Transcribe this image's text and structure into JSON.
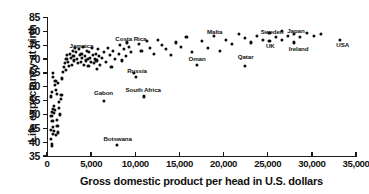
{
  "chart_data": {
    "type": "scatter",
    "title": "",
    "xlabel": "Gross domestic product per head in U.S. dollars",
    "ylabel": "Life expectancy at birth",
    "xlim": [
      0,
      35000
    ],
    "ylim": [
      35,
      85
    ],
    "grid": false,
    "legend": null,
    "xticks": [
      0,
      5000,
      10000,
      15000,
      20000,
      25000,
      30000,
      35000
    ],
    "xtick_labels": [
      "0",
      "5,000",
      "10,000",
      "15,000",
      "20,000",
      "25,000",
      "30,000",
      "35,000"
    ],
    "yticks": [
      35,
      40,
      45,
      50,
      55,
      60,
      65,
      70,
      75,
      80,
      85
    ],
    "ytick_labels": [
      "35",
      "40",
      "45",
      "50",
      "55",
      "60",
      "65",
      "70",
      "75",
      "80",
      "85"
    ],
    "marker": "filled-circle",
    "marker_color": "#0d0d0d",
    "annotations": [
      {
        "label": "Jamaica",
        "x": 3900,
        "y": 74.5
      },
      {
        "label": "Costa Rica",
        "x": 9500,
        "y": 77.0
      },
      {
        "label": "Russia",
        "x": 10200,
        "y": 65.5
      },
      {
        "label": "Gabon",
        "x": 6400,
        "y": 57.5
      },
      {
        "label": "South Africa",
        "x": 10900,
        "y": 58.5
      },
      {
        "label": "Botswana",
        "x": 8000,
        "y": 41.0
      },
      {
        "label": "Malta",
        "x": 19000,
        "y": 79.5
      },
      {
        "label": "Oman",
        "x": 17000,
        "y": 70.0
      },
      {
        "label": "Qatar",
        "x": 22500,
        "y": 70.5
      },
      {
        "label": "Sweden",
        "x": 25500,
        "y": 79.5
      },
      {
        "label": "UK",
        "x": 25300,
        "y": 74.5
      },
      {
        "label": "Japan",
        "x": 28200,
        "y": 80.0
      },
      {
        "label": "Ireland",
        "x": 28500,
        "y": 73.5
      },
      {
        "label": "USA",
        "x": 33500,
        "y": 75.0
      }
    ],
    "points": [
      {
        "x": 500,
        "y": 49.5
      },
      {
        "x": 560,
        "y": 51.0
      },
      {
        "x": 620,
        "y": 47.5
      },
      {
        "x": 430,
        "y": 44.5
      },
      {
        "x": 700,
        "y": 52.0
      },
      {
        "x": 760,
        "y": 50.5
      },
      {
        "x": 480,
        "y": 41.0
      },
      {
        "x": 540,
        "y": 39.5
      },
      {
        "x": 600,
        "y": 38.5
      },
      {
        "x": 820,
        "y": 53.0
      },
      {
        "x": 900,
        "y": 51.5
      },
      {
        "x": 640,
        "y": 43.0
      },
      {
        "x": 720,
        "y": 45.5
      },
      {
        "x": 780,
        "y": 44.0
      },
      {
        "x": 450,
        "y": 56.5
      },
      {
        "x": 520,
        "y": 58.0
      },
      {
        "x": 880,
        "y": 60.5
      },
      {
        "x": 960,
        "y": 62.0
      },
      {
        "x": 1050,
        "y": 59.0
      },
      {
        "x": 1130,
        "y": 57.5
      },
      {
        "x": 1200,
        "y": 61.5
      },
      {
        "x": 700,
        "y": 63.5
      },
      {
        "x": 640,
        "y": 65.0
      },
      {
        "x": 1320,
        "y": 54.5
      },
      {
        "x": 1400,
        "y": 52.5
      },
      {
        "x": 1480,
        "y": 50.0
      },
      {
        "x": 1100,
        "y": 48.0
      },
      {
        "x": 1180,
        "y": 46.0
      },
      {
        "x": 980,
        "y": 42.5
      },
      {
        "x": 1260,
        "y": 43.5
      },
      {
        "x": 1560,
        "y": 55.5
      },
      {
        "x": 1640,
        "y": 57.0
      },
      {
        "x": 1720,
        "y": 63.0
      },
      {
        "x": 1800,
        "y": 65.5
      },
      {
        "x": 1900,
        "y": 67.0
      },
      {
        "x": 2000,
        "y": 68.5
      },
      {
        "x": 2100,
        "y": 66.0
      },
      {
        "x": 2200,
        "y": 70.0
      },
      {
        "x": 2300,
        "y": 71.5
      },
      {
        "x": 2400,
        "y": 69.0
      },
      {
        "x": 2500,
        "y": 67.5
      },
      {
        "x": 2600,
        "y": 72.0
      },
      {
        "x": 2700,
        "y": 70.5
      },
      {
        "x": 2800,
        "y": 68.0
      },
      {
        "x": 2900,
        "y": 73.0
      },
      {
        "x": 3000,
        "y": 71.0
      },
      {
        "x": 3100,
        "y": 69.5
      },
      {
        "x": 3200,
        "y": 74.0
      },
      {
        "x": 3300,
        "y": 72.5
      },
      {
        "x": 3400,
        "y": 70.0
      },
      {
        "x": 3500,
        "y": 68.5
      },
      {
        "x": 3600,
        "y": 73.5
      },
      {
        "x": 3700,
        "y": 71.5
      },
      {
        "x": 3800,
        "y": 69.0
      },
      {
        "x": 3900,
        "y": 72.0
      },
      {
        "x": 4000,
        "y": 70.5
      },
      {
        "x": 4100,
        "y": 74.5
      },
      {
        "x": 4200,
        "y": 68.0
      },
      {
        "x": 4300,
        "y": 71.0
      },
      {
        "x": 4400,
        "y": 69.5
      },
      {
        "x": 4500,
        "y": 73.0
      },
      {
        "x": 4600,
        "y": 70.0
      },
      {
        "x": 4700,
        "y": 67.5
      },
      {
        "x": 4800,
        "y": 72.5
      },
      {
        "x": 4900,
        "y": 70.5
      },
      {
        "x": 5000,
        "y": 69.0
      },
      {
        "x": 5100,
        "y": 74.0
      },
      {
        "x": 5200,
        "y": 71.5
      },
      {
        "x": 5300,
        "y": 68.5
      },
      {
        "x": 5400,
        "y": 70.0
      },
      {
        "x": 5500,
        "y": 72.0
      },
      {
        "x": 5600,
        "y": 69.5
      },
      {
        "x": 5700,
        "y": 66.5
      },
      {
        "x": 5800,
        "y": 73.5
      },
      {
        "x": 5900,
        "y": 71.0
      },
      {
        "x": 6000,
        "y": 68.0
      },
      {
        "x": 6200,
        "y": 70.5
      },
      {
        "x": 6400,
        "y": 55.0
      },
      {
        "x": 6500,
        "y": 72.5
      },
      {
        "x": 6700,
        "y": 69.0
      },
      {
        "x": 6900,
        "y": 74.0
      },
      {
        "x": 7100,
        "y": 71.5
      },
      {
        "x": 7300,
        "y": 67.0
      },
      {
        "x": 7500,
        "y": 73.0
      },
      {
        "x": 7700,
        "y": 70.0
      },
      {
        "x": 7900,
        "y": 39.0
      },
      {
        "x": 8100,
        "y": 72.0
      },
      {
        "x": 8300,
        "y": 75.0
      },
      {
        "x": 8500,
        "y": 69.5
      },
      {
        "x": 8700,
        "y": 73.5
      },
      {
        "x": 8900,
        "y": 71.0
      },
      {
        "x": 9100,
        "y": 76.0
      },
      {
        "x": 9300,
        "y": 74.5
      },
      {
        "x": 9500,
        "y": 72.5
      },
      {
        "x": 9800,
        "y": 65.0
      },
      {
        "x": 10100,
        "y": 63.5
      },
      {
        "x": 10400,
        "y": 75.5
      },
      {
        "x": 10700,
        "y": 73.0
      },
      {
        "x": 11000,
        "y": 56.5
      },
      {
        "x": 11300,
        "y": 76.5
      },
      {
        "x": 11700,
        "y": 74.0
      },
      {
        "x": 12100,
        "y": 72.0
      },
      {
        "x": 12600,
        "y": 77.0
      },
      {
        "x": 13000,
        "y": 75.0
      },
      {
        "x": 13500,
        "y": 73.5
      },
      {
        "x": 14000,
        "y": 71.5
      },
      {
        "x": 14600,
        "y": 76.0
      },
      {
        "x": 15200,
        "y": 74.5
      },
      {
        "x": 15800,
        "y": 78.0
      },
      {
        "x": 16400,
        "y": 72.5
      },
      {
        "x": 17000,
        "y": 68.0
      },
      {
        "x": 17600,
        "y": 76.5
      },
      {
        "x": 18200,
        "y": 74.0
      },
      {
        "x": 18900,
        "y": 78.5
      },
      {
        "x": 19600,
        "y": 73.0
      },
      {
        "x": 20300,
        "y": 77.0
      },
      {
        "x": 21000,
        "y": 75.5
      },
      {
        "x": 21700,
        "y": 79.0
      },
      {
        "x": 22400,
        "y": 67.5
      },
      {
        "x": 22400,
        "y": 77.5
      },
      {
        "x": 23100,
        "y": 76.0
      },
      {
        "x": 23800,
        "y": 78.5
      },
      {
        "x": 24500,
        "y": 77.0
      },
      {
        "x": 25200,
        "y": 79.5
      },
      {
        "x": 25200,
        "y": 76.5
      },
      {
        "x": 25900,
        "y": 78.0
      },
      {
        "x": 26600,
        "y": 80.0
      },
      {
        "x": 26600,
        "y": 77.0
      },
      {
        "x": 27300,
        "y": 78.5
      },
      {
        "x": 28000,
        "y": 79.0
      },
      {
        "x": 28000,
        "y": 76.0
      },
      {
        "x": 28700,
        "y": 78.0
      },
      {
        "x": 29400,
        "y": 79.5
      },
      {
        "x": 30200,
        "y": 78.5
      },
      {
        "x": 31000,
        "y": 79.0
      },
      {
        "x": 33200,
        "y": 77.0
      }
    ]
  }
}
